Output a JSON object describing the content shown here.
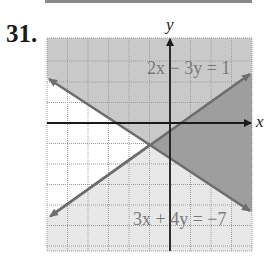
{
  "problem": {
    "number": "31."
  },
  "axes": {
    "x_label": "x",
    "y_label": "y"
  },
  "equations": {
    "line1": "2x − 3y = 1",
    "line2": "3x + 4y = −7"
  },
  "graph": {
    "x_range": [
      -6,
      4
    ],
    "y_range": [
      -6,
      4
    ],
    "intersection": [
      -1,
      -1
    ],
    "colors": {
      "region_top": "#c9c9c9",
      "region_right": "#9e9e9e",
      "region_bottom": "#e8e8e8",
      "region_left": "#ffffff",
      "line": "#6d6d6d",
      "axis": "#1a1a1a",
      "grid": "#9c9c9c",
      "label": "#7a7a7a"
    }
  }
}
